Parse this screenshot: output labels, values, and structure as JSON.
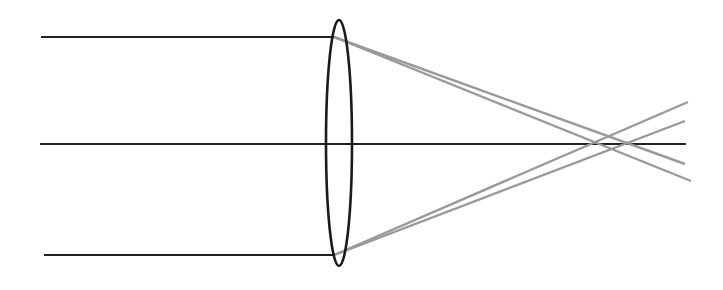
{
  "diagram": {
    "type": "optics-ray-diagram",
    "colors": {
      "incident_ray": "#222222",
      "refracted_ray": "#999999",
      "lens": "#1a1a1a",
      "background": "#ffffff"
    },
    "lens": {
      "cx": 339,
      "cy": 143,
      "rx": 13,
      "ry": 123
    },
    "incident_rays": [
      {
        "x1": 41,
        "y1": 37,
        "x2": 334,
        "y2": 37
      },
      {
        "x1": 40,
        "y1": 144,
        "x2": 686,
        "y2": 144
      },
      {
        "x1": 44,
        "y1": 255,
        "x2": 334,
        "y2": 255
      }
    ],
    "refracted_rays": [
      {
        "x1": 334,
        "y1": 37,
        "x2": 691,
        "y2": 181
      },
      {
        "x1": 334,
        "y1": 37,
        "x2": 685,
        "y2": 164
      },
      {
        "x1": 334,
        "y1": 255,
        "x2": 688,
        "y2": 102
      },
      {
        "x1": 334,
        "y1": 255,
        "x2": 685,
        "y2": 121
      }
    ]
  }
}
